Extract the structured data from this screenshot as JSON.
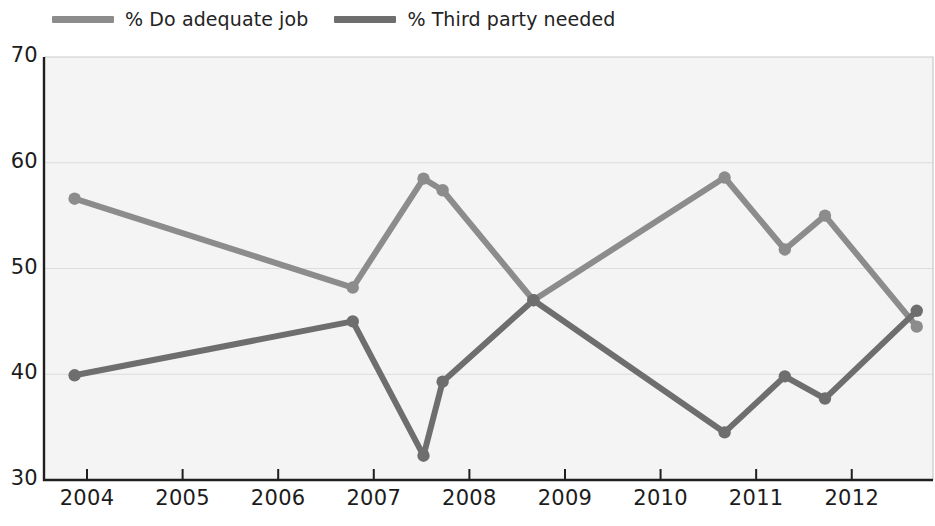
{
  "chart_data": {
    "type": "line",
    "title": "",
    "subtitle": "",
    "xlabel": "",
    "ylabel": "",
    "xlim": [
      2003.55,
      2012.85
    ],
    "ylim": [
      30,
      70
    ],
    "yticks": [
      30,
      40,
      50,
      60,
      70
    ],
    "xticks": [
      2004,
      2005,
      2006,
      2007,
      2008,
      2009,
      2010,
      2011,
      2012
    ],
    "grid": true,
    "grid_axis": "y",
    "legend_position": "top-left",
    "markers": true,
    "series": [
      {
        "name": "% Do adequate job",
        "color": "#8c8c8c",
        "points": [
          {
            "x": 2003.87,
            "y": 56.6
          },
          {
            "x": 2006.78,
            "y": 48.2
          },
          {
            "x": 2007.52,
            "y": 58.5
          },
          {
            "x": 2007.72,
            "y": 57.4
          },
          {
            "x": 2008.67,
            "y": 47.0
          },
          {
            "x": 2010.67,
            "y": 58.6
          },
          {
            "x": 2011.3,
            "y": 51.8
          },
          {
            "x": 2011.72,
            "y": 55.0
          },
          {
            "x": 2012.68,
            "y": 44.5
          }
        ]
      },
      {
        "name": "% Third party needed",
        "color": "#6e6e6e",
        "points": [
          {
            "x": 2003.87,
            "y": 39.9
          },
          {
            "x": 2006.78,
            "y": 45.0
          },
          {
            "x": 2007.52,
            "y": 32.3
          },
          {
            "x": 2007.72,
            "y": 39.3
          },
          {
            "x": 2008.67,
            "y": 47.0
          },
          {
            "x": 2010.67,
            "y": 34.5
          },
          {
            "x": 2011.3,
            "y": 39.8
          },
          {
            "x": 2011.72,
            "y": 37.7
          },
          {
            "x": 2012.68,
            "y": 46.0
          }
        ]
      }
    ]
  },
  "legend": {
    "entries": [
      {
        "label": "% Do adequate job",
        "color": "#8c8c8c"
      },
      {
        "label": "% Third party needed",
        "color": "#6e6e6e"
      }
    ]
  },
  "axes": {
    "y_tick_labels": [
      "70",
      "60",
      "50",
      "40",
      "30"
    ],
    "x_tick_labels": [
      "2004",
      "2005",
      "2006",
      "2007",
      "2008",
      "2009",
      "2010",
      "2011",
      "2012"
    ]
  },
  "colors": {
    "series_light": "#8c8c8c",
    "series_dark": "#6e6e6e",
    "plot_background": "#f4f4f4",
    "axis": "#1f1f1f",
    "grid": "#dcdcdc",
    "text": "#1c1c1c"
  }
}
